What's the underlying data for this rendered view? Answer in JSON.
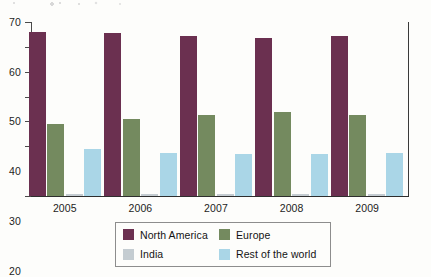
{
  "chart_data": {
    "type": "bar",
    "title": "",
    "subtitle": "",
    "xlabel": "",
    "ylabel": "",
    "categories": [
      "2005",
      "2006",
      "2007",
      "2008",
      "2009"
    ],
    "ylim": [
      0,
      70
    ],
    "y_ticks": [
      "0",
      "20",
      "30",
      "40",
      "50",
      "60",
      "70"
    ],
    "y_tick_values": [
      0,
      20,
      30,
      40,
      50,
      60,
      70
    ],
    "grid": false,
    "legend_position": "bottom",
    "series": [
      {
        "name": "North America",
        "color": "#6b3050",
        "values": [
          66,
          65.5,
          64.5,
          63.5,
          64.5
        ]
      },
      {
        "name": "Europe",
        "color": "#748a5f",
        "values": [
          29,
          31,
          32.5,
          34,
          32.5
        ]
      },
      {
        "name": "India",
        "color": "#c4ccd1",
        "values": [
          1,
          1,
          1,
          1,
          1
        ]
      },
      {
        "name": "Rest of the world",
        "color": "#aad6e7",
        "values": [
          19,
          17.5,
          17,
          17,
          17.5
        ]
      }
    ]
  },
  "legend": {
    "items": [
      {
        "label": "North  America",
        "color": "#6b3050"
      },
      {
        "label": "Europe",
        "color": "#748a5f"
      },
      {
        "label": "India",
        "color": "#c4ccd1"
      },
      {
        "label": "Rest of the world",
        "color": "#aad6e7"
      }
    ]
  }
}
